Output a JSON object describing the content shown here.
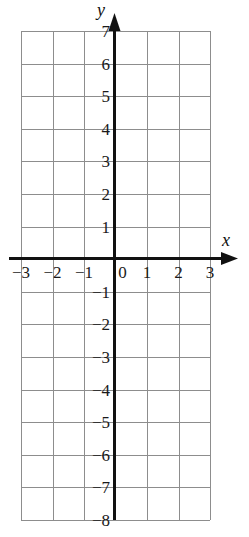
{
  "chart_data": {
    "type": "scatter",
    "title": "",
    "xlabel": "x",
    "ylabel": "y",
    "grid": true,
    "legend": null,
    "series": [],
    "xlim": [
      -3,
      3
    ],
    "ylim": [
      -8,
      7
    ],
    "xticks": [
      -3,
      -2,
      -1,
      0,
      1,
      2,
      3
    ],
    "yticks": [
      7,
      6,
      5,
      4,
      3,
      2,
      1,
      -1,
      -2,
      -3,
      -4,
      -5,
      -6,
      -7,
      -8
    ],
    "xtick_labels": [
      "−3",
      "−2",
      "−1",
      "0",
      "1",
      "2",
      "3"
    ],
    "ytick_labels": [
      "7",
      "6",
      "5",
      "4",
      "3",
      "2",
      "1",
      "−1",
      "−2",
      "−3",
      "−4",
      "−5",
      "−6",
      "−7",
      "−8"
    ],
    "origin_label": "0",
    "x_step": 1,
    "y_step": 1,
    "colors": {
      "grid": "#8d8d8d",
      "axis": "#111111",
      "text": "#1a1a1a",
      "background": "#ffffff"
    }
  },
  "axes": {
    "x_name": "x",
    "y_name": "y"
  },
  "geometry": {
    "grid_left": 21,
    "grid_right": 210,
    "grid_top": 31,
    "grid_bottom": 520,
    "y_axis_x": 114,
    "x_axis_y": 258,
    "cell_w": 31.5,
    "cell_h": 32.6
  }
}
